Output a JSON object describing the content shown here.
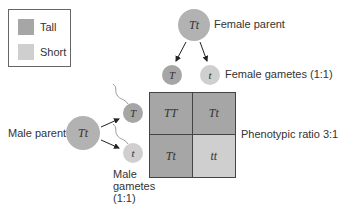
{
  "colors": {
    "tall": "#a6a6a6",
    "short": "#cfcfcf",
    "parent_circle": "#b2b2b2",
    "gamete_T": "#a6a6a6",
    "gamete_t": "#cfcfcf"
  },
  "legend": {
    "items": [
      {
        "label": "Tall",
        "color": "#a6a6a6"
      },
      {
        "label": "Short",
        "color": "#cfcfcf"
      }
    ]
  },
  "female": {
    "parent_genotype": "Tt",
    "parent_label": "Female parent",
    "gametes": [
      "T",
      "t"
    ],
    "gametes_label": "Female gametes (1:1)"
  },
  "male": {
    "parent_genotype": "Tt",
    "parent_label": "Male parent",
    "gametes": [
      "T",
      "t"
    ],
    "gametes_label_lines": [
      "Male",
      "gametes",
      "(1:1)"
    ]
  },
  "punnett": {
    "cells": [
      {
        "genotype": "TT",
        "phenotype": "Tall"
      },
      {
        "genotype": "Tt",
        "phenotype": "Tall"
      },
      {
        "genotype": "Tt",
        "phenotype": "Tall"
      },
      {
        "genotype": "tt",
        "phenotype": "Short"
      }
    ],
    "ratio_label": "Phenotypic ratio 3:1"
  }
}
